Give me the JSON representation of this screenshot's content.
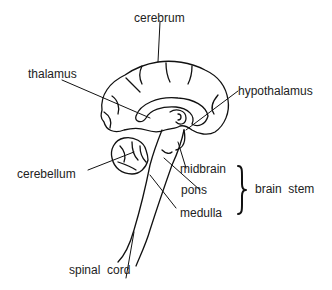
{
  "diagram": {
    "type": "labeled anatomy diagram",
    "labels": {
      "cerebrum": "cerebrum",
      "thalamus": "thalamus",
      "hypothalamus": "hypothalamus",
      "cerebellum": "cerebellum",
      "midbrain": "midbrain",
      "pons": "pons",
      "medulla": "medulla",
      "brain_stem": "brain  stem",
      "spinal_cord": "spinal  cord"
    }
  }
}
